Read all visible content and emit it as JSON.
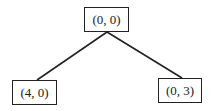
{
  "diagram": {
    "type": "tree",
    "nodes": [
      {
        "id": "root",
        "label": "(0, 0)"
      },
      {
        "id": "left",
        "label": "(4, 0)"
      },
      {
        "id": "right",
        "label": "(0, 3)"
      }
    ],
    "edges": [
      {
        "from": "root",
        "to": "left"
      },
      {
        "from": "root",
        "to": "right"
      }
    ],
    "colors": {
      "line": "#222222",
      "background": "#ffffff"
    }
  }
}
